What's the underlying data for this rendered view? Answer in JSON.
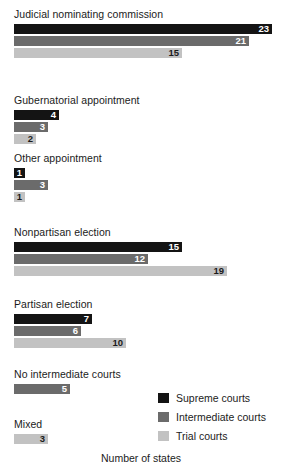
{
  "chart_data": {
    "type": "bar",
    "orientation": "horizontal",
    "title": "",
    "xlabel": "Number of states",
    "ylabel": "",
    "xlim": [
      0,
      23
    ],
    "grid": false,
    "legend_position": "bottom-right",
    "series_names": [
      "Supreme courts",
      "Intermediate courts",
      "Trial courts"
    ],
    "series_colors": [
      "#141414",
      "#6b6b6b",
      "#c2c2c2"
    ],
    "categories": [
      "Judicial nominating commission",
      "Gubernatorial appointment",
      "Other appointment",
      "Nonpartisan election",
      "Partisan election",
      "No intermediate courts",
      "Mixed"
    ],
    "series": [
      {
        "name": "Supreme courts",
        "values": [
          23,
          4,
          1,
          15,
          7,
          null,
          null
        ]
      },
      {
        "name": "Intermediate courts",
        "values": [
          21,
          3,
          3,
          12,
          6,
          5,
          null
        ]
      },
      {
        "name": "Trial courts",
        "values": [
          15,
          2,
          1,
          19,
          10,
          null,
          3
        ]
      }
    ]
  },
  "groups": [
    {
      "label": "Judicial nominating commission",
      "bars": [
        {
          "series": 0,
          "value": "23"
        },
        {
          "series": 1,
          "value": "21"
        },
        {
          "series": 2,
          "value": "15"
        }
      ]
    },
    {
      "label": "Gubernatorial appointment",
      "bars": [
        {
          "series": 0,
          "value": "4"
        },
        {
          "series": 1,
          "value": "3"
        },
        {
          "series": 2,
          "value": "2"
        }
      ]
    },
    {
      "label": "Other appointment",
      "bars": [
        {
          "series": 0,
          "value": "1"
        },
        {
          "series": 1,
          "value": "3"
        },
        {
          "series": 2,
          "value": "1"
        }
      ]
    },
    {
      "label": "Nonpartisan election",
      "bars": [
        {
          "series": 0,
          "value": "15"
        },
        {
          "series": 1,
          "value": "12"
        },
        {
          "series": 2,
          "value": "19"
        }
      ]
    },
    {
      "label": "Partisan election",
      "bars": [
        {
          "series": 0,
          "value": "7"
        },
        {
          "series": 1,
          "value": "6"
        },
        {
          "series": 2,
          "value": "10"
        }
      ]
    },
    {
      "label": "No intermediate courts",
      "bars": [
        {
          "series": 1,
          "value": "5"
        }
      ]
    },
    {
      "label": "Mixed",
      "bars": [
        {
          "series": 2,
          "value": "3"
        }
      ]
    }
  ],
  "legend": {
    "items": [
      {
        "label": "Supreme courts",
        "color": "#141414"
      },
      {
        "label": "Intermediate courts",
        "color": "#6b6b6b"
      },
      {
        "label": "Trial courts",
        "color": "#c2c2c2"
      }
    ]
  },
  "axis": {
    "xlabel": "Number of states"
  }
}
